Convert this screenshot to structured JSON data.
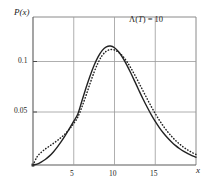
{
  "chart_data": {
    "type": "line",
    "title": "",
    "xlabel": "x",
    "ylabel": "P(x)",
    "xlim": [
      0,
      20
    ],
    "ylim": [
      0,
      0.13
    ],
    "grid": true,
    "legend": false,
    "xticks": [
      5,
      10,
      15
    ],
    "xtick_labels": [
      "5",
      "10",
      "15"
    ],
    "yticks": [
      0.05,
      0.1
    ],
    "ytick_labels": [
      "0.05",
      "0.1"
    ],
    "annotations": [
      {
        "name": "lambda-T-annotation",
        "text": "Λ(T) = 10",
        "lambda": "Λ(",
        "variable": "T",
        "equals": ") = 10",
        "x": 14.5,
        "y": 0.122
      }
    ],
    "series": [
      {
        "name": "exact-distribution",
        "style": "solid",
        "color": "#222222",
        "x": [
          0,
          0.5,
          1,
          1.5,
          2,
          2.5,
          3,
          3.5,
          4,
          4.5,
          5,
          5.5,
          6,
          6.5,
          7,
          7.5,
          8,
          8.5,
          9,
          9.5,
          10,
          10.5,
          11,
          11.5,
          12,
          12.5,
          13,
          13.5,
          14,
          14.5,
          15,
          15.5,
          16,
          16.5,
          17,
          17.5,
          18,
          18.5,
          19,
          19.5,
          20
        ],
        "y": [
          0.0,
          0.0008,
          0.0025,
          0.0048,
          0.0078,
          0.0115,
          0.0159,
          0.0209,
          0.0264,
          0.0323,
          0.0385,
          0.0448,
          0.0562,
          0.0676,
          0.0782,
          0.0876,
          0.0952,
          0.1007,
          0.1038,
          0.1045,
          0.103,
          0.0995,
          0.0944,
          0.088,
          0.0808,
          0.0732,
          0.0655,
          0.058,
          0.0509,
          0.0443,
          0.0383,
          0.0329,
          0.0281,
          0.0239,
          0.0202,
          0.017,
          0.0143,
          0.0119,
          0.0099,
          0.0082,
          0.0068
        ]
      },
      {
        "name": "approximation-distribution",
        "style": "dotted",
        "color": "#222222",
        "x": [
          0,
          0.5,
          1,
          1.5,
          2,
          2.5,
          3,
          3.5,
          4,
          4.5,
          5,
          5.5,
          6,
          6.5,
          7,
          7.5,
          8,
          8.5,
          9,
          9.5,
          10,
          10.5,
          11,
          11.5,
          12,
          12.5,
          13,
          13.5,
          14,
          14.5,
          15,
          15.5,
          16,
          16.5,
          17,
          17.5,
          18,
          18.5,
          19,
          19.5,
          20
        ],
        "y": [
          0.0,
          0.0072,
          0.011,
          0.014,
          0.0165,
          0.019,
          0.0216,
          0.0245,
          0.0278,
          0.0318,
          0.0365,
          0.0421,
          0.051,
          0.061,
          0.0716,
          0.0816,
          0.09,
          0.0963,
          0.1,
          0.1014,
          0.101,
          0.099,
          0.0956,
          0.091,
          0.0853,
          0.0789,
          0.0721,
          0.0651,
          0.0582,
          0.0515,
          0.0452,
          0.0394,
          0.0341,
          0.0294,
          0.0252,
          0.0215,
          0.0183,
          0.0155,
          0.0131,
          0.011,
          0.0093
        ]
      }
    ]
  }
}
